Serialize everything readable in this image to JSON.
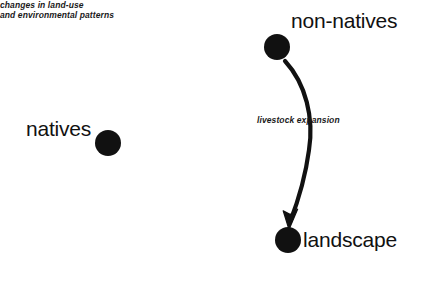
{
  "diagram": {
    "background_color": "#ffffff",
    "node_color": "#111111",
    "edge_color": "#111111",
    "nodes": [
      {
        "id": "natives",
        "label": "natives",
        "cx": 108,
        "cy": 143,
        "r": 13
      },
      {
        "id": "non-natives",
        "label": "non-natives",
        "cx": 277,
        "cy": 47,
        "r": 13
      },
      {
        "id": "landscape",
        "label": "landscape",
        "cx": 288,
        "cy": 240,
        "r": 13
      }
    ],
    "edges": [
      {
        "id": "non-natives-to-landscape",
        "from": "non-natives",
        "to": "landscape",
        "label": "livestock expansion",
        "arrow": "down",
        "curved": true
      }
    ],
    "captions": [
      {
        "id": "landscape-caption",
        "for": "landscape",
        "line1": "changes in land-use",
        "line2": "and environmental patterns"
      }
    ]
  }
}
